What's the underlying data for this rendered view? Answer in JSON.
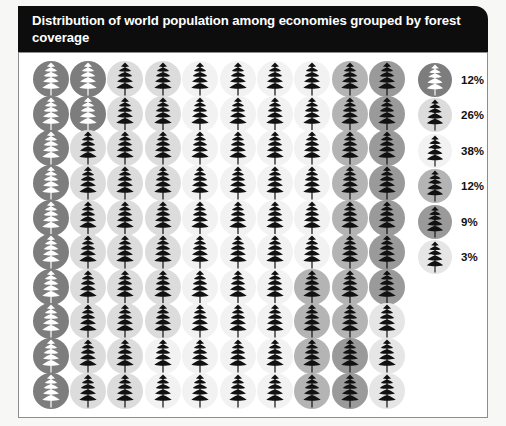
{
  "title": {
    "line1": "Distribution of world population among economies grouped",
    "line2": "by forest coverage",
    "full": "Distribution of world population among economies grouped by forest coverage"
  },
  "colors": {
    "title_bar": "#0d0d0d",
    "title_text": "#ffffff",
    "panel_bg": "#ffffff",
    "panel_border": "#8d8d8d",
    "page_bg": "#f7f7f5",
    "tree_dark": "#111111",
    "tree_light": "#ffffff"
  },
  "chart_data": {
    "type": "pie",
    "title": "Distribution of world population among economies grouped by forest coverage",
    "subtitle": "",
    "xlabel": "",
    "ylabel": "",
    "unit": "%",
    "total": 100,
    "grid_columns": 10,
    "grid_rows": 10,
    "cell_count": 100,
    "fill_order": "column-major-top-to-bottom",
    "glyph": "tree-icon",
    "legend_position": "right",
    "categories": [
      "12%",
      "26%",
      "38%",
      "12%",
      "9%",
      "3%"
    ],
    "values": [
      12,
      26,
      38,
      12,
      9,
      3
    ],
    "series": [
      {
        "name": "group-1",
        "label": "12%",
        "value": 12,
        "disc_color": "#7d7d7d",
        "tree_color": "#ffffff"
      },
      {
        "name": "group-2",
        "label": "26%",
        "value": 26,
        "disc_color": "#dcdcdc",
        "tree_color": "#111111"
      },
      {
        "name": "group-3",
        "label": "38%",
        "value": 38,
        "disc_color": "#f2f2f2",
        "tree_color": "#111111"
      },
      {
        "name": "group-4",
        "label": "12%",
        "value": 12,
        "disc_color": "#b4b4b4",
        "tree_color": "#111111"
      },
      {
        "name": "group-5",
        "label": "9%",
        "value": 9,
        "disc_color": "#9a9a9a",
        "tree_color": "#111111"
      },
      {
        "name": "group-6",
        "label": "3%",
        "value": 3,
        "disc_color": "#e6e6e6",
        "tree_color": "#111111"
      }
    ]
  },
  "legend": {
    "items": [
      {
        "label": "12%",
        "name": "legend-item-12-dark"
      },
      {
        "label": "26%",
        "name": "legend-item-26"
      },
      {
        "label": "38%",
        "name": "legend-item-38"
      },
      {
        "label": "12%",
        "name": "legend-item-12-medium"
      },
      {
        "label": "9%",
        "name": "legend-item-9"
      },
      {
        "label": "3%",
        "name": "legend-item-3"
      }
    ]
  }
}
